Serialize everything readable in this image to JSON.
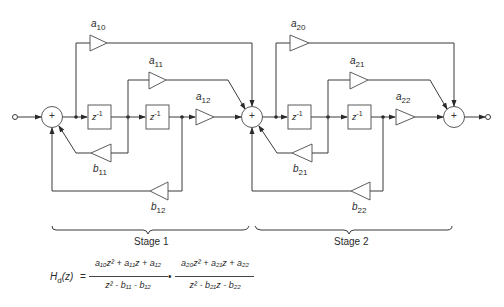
{
  "diagram": {
    "gains": {
      "a10": "a",
      "a10_sub": "10",
      "a11": "a",
      "a11_sub": "11",
      "a12": "a",
      "a12_sub": "12",
      "b11": "b",
      "b11_sub": "11",
      "b12": "b",
      "b12_sub": "12",
      "a20": "a",
      "a20_sub": "20",
      "a21": "a",
      "a21_sub": "21",
      "a22": "a",
      "a22_sub": "22",
      "b21": "b",
      "b21_sub": "21",
      "b22": "b",
      "b22_sub": "22"
    },
    "delay": {
      "base": "z",
      "exp": "-1"
    },
    "adder_symbol": "+",
    "stages": [
      {
        "label": "Stage 1"
      },
      {
        "label": "Stage 2"
      }
    ],
    "equation": {
      "lhs": "H",
      "lhs_sub": "d",
      "lhs_arg": "(z)",
      "equals": "=",
      "frac1_num": "a₁₀z² + a₁₁z + a₁₂",
      "frac1_den": "z² - b₁₁ - b₁₂",
      "dot": "•",
      "frac2_num": "a₂₀z² + a₂₁z + a₂₂",
      "frac2_den": "z² - b₂₁z - b₂₂"
    }
  }
}
